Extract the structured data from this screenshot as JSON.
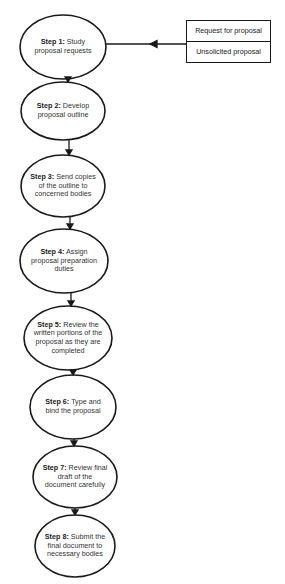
{
  "diagram": {
    "type": "flowchart",
    "colors": {
      "stroke": "#1a1a1a",
      "text": "#333333",
      "background": "#ffffff"
    },
    "input_sources": [
      {
        "label": "Request for proposal"
      },
      {
        "label": "Unsolicited proposal"
      }
    ],
    "steps": [
      {
        "prefix": "Step 1:",
        "text": "Study proposal requests",
        "lines": [
          "Study",
          "proposal requests"
        ]
      },
      {
        "prefix": "Step 2:",
        "text": "Develop proposal outline",
        "lines": [
          "Develop",
          "proposal outline"
        ]
      },
      {
        "prefix": "Step 3:",
        "text": "Send copies of the outline to concerned bodies",
        "lines": [
          "Send copies",
          "of the outline to",
          "concerned bodies"
        ]
      },
      {
        "prefix": "Step 4:",
        "text": "Assign proposal preparation duties",
        "lines": [
          "Assign",
          "proposal preparation",
          "duties"
        ]
      },
      {
        "prefix": "Step 5:",
        "text": "Review the written portions of the proposal as they are completed",
        "lines": [
          "Review the",
          "written portions of the",
          "proposal as they are",
          "completed"
        ]
      },
      {
        "prefix": "Step 6:",
        "text": "Type and bind the proposal",
        "lines": [
          "Type and",
          "bind the proposal"
        ]
      },
      {
        "prefix": "Step 7:",
        "text": "Review final draft of the document carefully",
        "lines": [
          "Review final",
          "draft of the",
          "document carefully"
        ]
      },
      {
        "prefix": "Step 8:",
        "text": "Submit the final document to necessary bodies",
        "lines": [
          "Submit the",
          "final document to",
          "necessary bodies"
        ]
      }
    ],
    "edges": [
      {
        "from": "input_sources",
        "to": "step-1"
      },
      {
        "from": "step-1",
        "to": "step-2"
      },
      {
        "from": "step-2",
        "to": "step-3"
      },
      {
        "from": "step-3",
        "to": "step-4"
      },
      {
        "from": "step-4",
        "to": "step-5"
      },
      {
        "from": "step-5",
        "to": "step-6"
      },
      {
        "from": "step-6",
        "to": "step-7"
      },
      {
        "from": "step-7",
        "to": "step-8"
      }
    ]
  }
}
